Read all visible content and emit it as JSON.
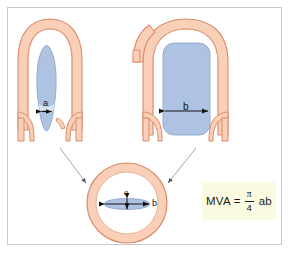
{
  "figure": {
    "background_color": "#ffffff",
    "frame_border_color": "#c9c9c9"
  },
  "palette": {
    "tissue_fill": "#f9cfb8",
    "tissue_stroke": "#d98b6a",
    "tissue_inner_fill": "#fbe0d2",
    "valve_blue_fill": "#aec3e2",
    "valve_blue_stroke": "#8fa6cd",
    "formula_box_fill": "#fbfbe1",
    "connector_line": "#9a9a9a",
    "arrow_black": "#111111",
    "text_color": "#1a1a1a"
  },
  "panels": {
    "left_view": {
      "name": "stenotic valve long-axis view",
      "dimension_label": "a",
      "description": "narrow slit-like valve orifice"
    },
    "right_view": {
      "name": "orthogonal long-axis view",
      "dimension_label": "b",
      "description": "wide valve orifice"
    },
    "cross_section": {
      "name": "short-axis cross section",
      "vertical_label": "a",
      "horizontal_label": "b",
      "description": "annulus ring with elliptical orifice"
    }
  },
  "formula": {
    "lhs": "MVA",
    "equals": "=",
    "numerator": "π",
    "denominator": "4",
    "rhs": "ab",
    "full_text": "MVA = π/4 ab"
  }
}
